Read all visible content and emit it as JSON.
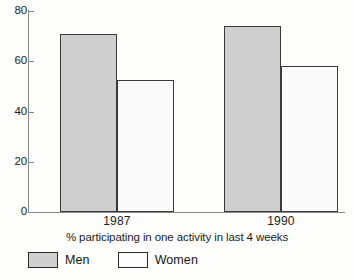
{
  "chart_data": {
    "type": "bar",
    "title": "",
    "subtitle": "",
    "xlabel": "% participating in one activity in last 4 weeks",
    "ylabel": "",
    "categories": [
      "1987",
      "1990"
    ],
    "series": [
      {
        "name": "Men",
        "values": [
          71,
          74
        ],
        "color": "#cfcfcf"
      },
      {
        "name": "Women",
        "values": [
          52.5,
          58
        ],
        "color": "#fafafa"
      }
    ],
    "ylim": [
      0,
      80
    ],
    "yticks": [
      0,
      20,
      40,
      60,
      80
    ],
    "ytick_labels": [
      "0",
      "20",
      "40",
      "60",
      "80"
    ],
    "grid": false,
    "legend_position": "bottom-left",
    "bar_outline_color": "#3a3a3a",
    "axis_color": "#8a8a8a",
    "background_color": "#fdfdfb"
  },
  "legend": {
    "entries": [
      {
        "label": "Men",
        "swatch": "men-swatch"
      },
      {
        "label": "Women",
        "swatch": "women-swatch"
      }
    ]
  }
}
